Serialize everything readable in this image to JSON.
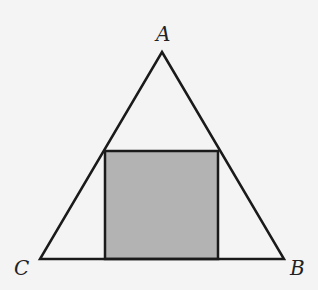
{
  "diagram": {
    "type": "geometry",
    "colors": {
      "background": "#f4f4f4",
      "stroke": "#1a1a1a",
      "square_fill": "#b3b3b3"
    },
    "vertices": {
      "A": {
        "label": "A",
        "x": 162,
        "y": 52
      },
      "B": {
        "label": "B",
        "x": 284,
        "y": 259
      },
      "C": {
        "label": "C",
        "x": 40,
        "y": 259
      }
    },
    "square": {
      "x": 105,
      "y": 151,
      "width": 113,
      "height": 108
    },
    "labels": {
      "A": {
        "text": "A",
        "x": 156,
        "y": 41
      },
      "B": {
        "text": "B",
        "x": 290,
        "y": 275
      },
      "C": {
        "text": "C",
        "x": 14,
        "y": 275
      }
    }
  }
}
